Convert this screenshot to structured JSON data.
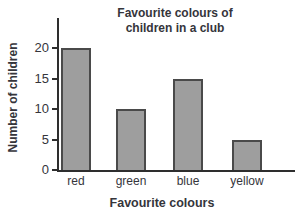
{
  "chart_data": {
    "type": "bar",
    "title_lines": [
      "Favourite colours of",
      "children in a club"
    ],
    "categories": [
      "red",
      "green",
      "blue",
      "yellow"
    ],
    "values": [
      20,
      10,
      15,
      5
    ],
    "xlabel": "Favourite colours",
    "ylabel": "Number of children",
    "yticks": [
      0,
      5,
      10,
      15,
      20
    ],
    "ylim": [
      0,
      25
    ],
    "grid": false,
    "legend": "none",
    "colors": {
      "bar_fill": "#9e9e9e",
      "bar_border": "#4a4a4a",
      "axis": "#2e2e2e",
      "text": "#35353b",
      "background": "#ffffff"
    }
  }
}
